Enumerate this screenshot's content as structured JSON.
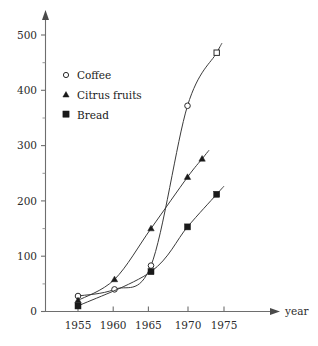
{
  "chart_data": {
    "type": "line",
    "title": "",
    "subtitle": "",
    "xlabel": "year",
    "ylabel": "",
    "xlim": [
      1953.2,
      1979.0
    ],
    "ylim": [
      0,
      530
    ],
    "grid": false,
    "legend_position": "upper-left-inside",
    "x_ticks": [
      1955,
      1960,
      1965,
      1970,
      1975
    ],
    "x_tick_labels": [
      "1955",
      "1960",
      "1965",
      "1970",
      "1975"
    ],
    "y_ticks": [
      0,
      100,
      200,
      300,
      400,
      500
    ],
    "y_tick_labels": [
      "0",
      "100",
      "200",
      "300",
      "400",
      "500"
    ],
    "y_minor_ticks": [
      50,
      150,
      250,
      350,
      450
    ],
    "axis_arrows": [
      "x-right",
      "y-up"
    ],
    "series": [
      {
        "name": "Coffee",
        "marker": "open-circle",
        "end_marker": "open-square",
        "x": [
          1955,
          1960,
          1965,
          1970,
          1974
        ],
        "values": [
          28,
          40,
          83,
          372,
          468
        ]
      },
      {
        "name": "Citrus fruits",
        "marker": "filled-triangle",
        "end_marker": "filled-triangle",
        "x": [
          1955,
          1960,
          1965,
          1970,
          1972
        ],
        "values": [
          20,
          58,
          150,
          243,
          276
        ]
      },
      {
        "name": "Bread",
        "marker": "filled-square",
        "end_marker": "filled-square",
        "x": [
          1955,
          1965,
          1970,
          1974
        ],
        "values": [
          10,
          72,
          153,
          212
        ]
      }
    ]
  },
  "axis": {
    "x_title": "year",
    "y_tick_0": "0",
    "y_tick_100": "100",
    "y_tick_200": "200",
    "y_tick_300": "300",
    "y_tick_400": "400",
    "y_tick_500": "500",
    "x_tick_1955": "1955",
    "x_tick_1960": "1960",
    "x_tick_1965": "1965",
    "x_tick_1970": "1970",
    "x_tick_1975": "1975"
  },
  "legend": {
    "items": [
      {
        "label": "Coffee",
        "marker": "open-circle-icon"
      },
      {
        "label": "Citrus fruits",
        "marker": "filled-triangle-icon"
      },
      {
        "label": "Bread",
        "marker": "filled-square-icon"
      }
    ]
  },
  "colors": {
    "line": "#3b3b3b",
    "axis": "#6e6e6e",
    "text": "#1a1a1a",
    "background": "#ffffff"
  }
}
